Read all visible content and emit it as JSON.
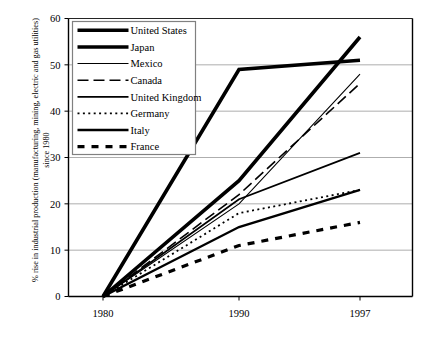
{
  "chart_data": {
    "type": "line",
    "title": "",
    "xlabel": "",
    "ylabel": "% rise in industrial production (manufacturing, mining, electric and gas utilities) since 1980",
    "x": [
      "1980",
      "1990",
      "1997"
    ],
    "xtick_labels": [
      "1980",
      "1990",
      "1997"
    ],
    "ytick_labels": [
      "0",
      "10",
      "20",
      "30",
      "40",
      "50",
      "60"
    ],
    "ylim": [
      0,
      60
    ],
    "ytick_step": 10,
    "grid": "horizontal",
    "legend_position": "top-left-inside",
    "series": [
      {
        "name": "United States",
        "values": [
          0,
          25,
          56
        ],
        "style": "solid",
        "width": 3.6,
        "color": "#000000"
      },
      {
        "name": "Japan",
        "values": [
          0,
          49,
          51
        ],
        "style": "solid",
        "width": 3.6,
        "color": "#000000"
      },
      {
        "name": "Mexico",
        "values": [
          0,
          20,
          48
        ],
        "style": "solid",
        "width": 1.1,
        "color": "#000000"
      },
      {
        "name": "Canada",
        "values": [
          0,
          22,
          46
        ],
        "style": "dash-long",
        "width": 1.6,
        "color": "#000000"
      },
      {
        "name": "United Kingdom",
        "values": [
          0,
          21,
          31
        ],
        "style": "solid",
        "width": 1.8,
        "color": "#000000"
      },
      {
        "name": "Germany",
        "values": [
          0,
          18,
          23
        ],
        "style": "dotted",
        "width": 1.8,
        "color": "#000000"
      },
      {
        "name": "Italy",
        "values": [
          0,
          15,
          23
        ],
        "style": "solid",
        "width": 2.4,
        "color": "#000000"
      },
      {
        "name": "France",
        "values": [
          0,
          11,
          16
        ],
        "style": "dash-thick",
        "width": 3.2,
        "color": "#000000"
      }
    ]
  },
  "axes": {
    "frame_color": "#000000",
    "gridline_color": "#999999"
  },
  "legend": {
    "border_color": "#808080",
    "background": "#ffffff",
    "items": [
      {
        "label": "United States"
      },
      {
        "label": "Japan"
      },
      {
        "label": "Mexico"
      },
      {
        "label": "Canada"
      },
      {
        "label": "United Kingdom"
      },
      {
        "label": "Germany"
      },
      {
        "label": "Italy"
      },
      {
        "label": "France"
      }
    ]
  }
}
